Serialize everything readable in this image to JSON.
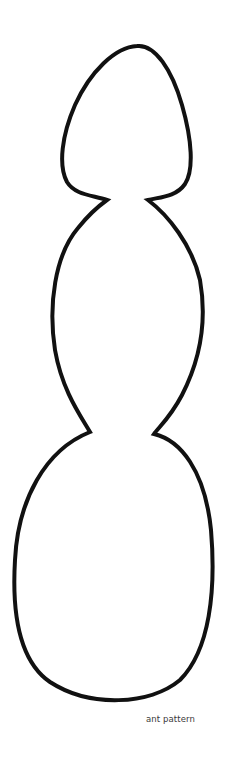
{
  "caption": "ant pattern",
  "outline": {
    "stroke_color": "#111111",
    "stroke_width": 4,
    "segments": [
      "head",
      "thorax",
      "abdomen"
    ]
  }
}
